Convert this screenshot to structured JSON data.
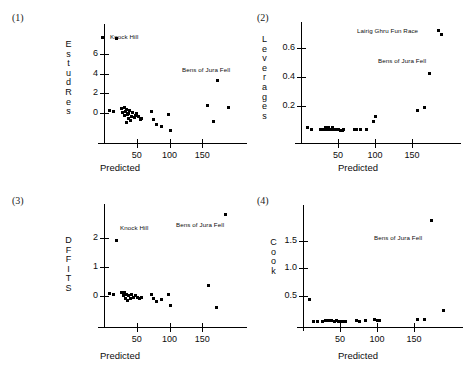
{
  "figure": {
    "background": "#ffffff",
    "marker_color": "#000000",
    "axis_color": "#000000",
    "width": 457,
    "height": 376
  },
  "panels": [
    {
      "number": "(1)",
      "ylabel": "EstudRes",
      "xlabel": "Predicted",
      "yticks": [
        "0",
        "2",
        "4",
        "6"
      ],
      "xticks": [
        "50",
        "100",
        "150"
      ],
      "annotations": [
        {
          "text": "Knock Hill",
          "has_marker": true
        },
        {
          "text": "Bens of Jura Fell",
          "has_marker": false
        }
      ]
    },
    {
      "number": "(2)",
      "ylabel": "Leverages",
      "xlabel": "Predicted",
      "yticks": [
        "0.2",
        "0.4",
        "0.6"
      ],
      "xticks": [
        "50",
        "100",
        "150"
      ],
      "annotations": [
        {
          "text": "Lairig Ghru Fun Race",
          "has_marker": true
        },
        {
          "text": "Bens of Jura Fell",
          "has_marker": false
        }
      ]
    },
    {
      "number": "(3)",
      "ylabel": "DFFITS",
      "xlabel": "Predicted",
      "yticks": [
        "0",
        "1",
        "2"
      ],
      "xticks": [
        "50",
        "100",
        "150"
      ],
      "annotations": [
        {
          "text": "Knock Hill",
          "has_marker": false
        },
        {
          "text": "Bens of Jura Fell",
          "has_marker": false
        }
      ]
    },
    {
      "number": "(4)",
      "ylabel": "Cook",
      "xlabel": "Predicted",
      "yticks": [
        "0.5",
        "1.0",
        "1.5"
      ],
      "xticks": [
        "50",
        "100",
        "150"
      ],
      "annotations": [
        {
          "text": "Bens of Jura Fell",
          "has_marker": false
        }
      ]
    }
  ],
  "chart_data": [
    {
      "type": "scatter",
      "title": "(1)",
      "xlabel": "Predicted",
      "ylabel": "EstudRes",
      "xlim": [
        0,
        200
      ],
      "ylim": [
        -2.2,
        8.2
      ],
      "xticks": [
        50,
        100,
        150
      ],
      "yticks": [
        0,
        2,
        4,
        6
      ],
      "grid": false,
      "legend": "none",
      "annotations": [
        {
          "text": "Knock Hill",
          "x": 25,
          "y": 7.6
        },
        {
          "text": "Bens of Jura Fell",
          "x": 160,
          "y": 4.5
        }
      ],
      "points": [
        {
          "x": 9,
          "y": 0.3
        },
        {
          "x": 14,
          "y": 0.2
        },
        {
          "x": 19,
          "y": 7.5
        },
        {
          "x": 27,
          "y": 0.5
        },
        {
          "x": 29,
          "y": 0.1
        },
        {
          "x": 31,
          "y": 0.6
        },
        {
          "x": 32,
          "y": -0.2
        },
        {
          "x": 33,
          "y": 0.2
        },
        {
          "x": 34,
          "y": -0.9
        },
        {
          "x": 35,
          "y": 0.4
        },
        {
          "x": 36,
          "y": -0.1
        },
        {
          "x": 37,
          "y": 0.0
        },
        {
          "x": 38,
          "y": -0.5
        },
        {
          "x": 39,
          "y": 0.3
        },
        {
          "x": 40,
          "y": -0.7
        },
        {
          "x": 42,
          "y": -0.3
        },
        {
          "x": 44,
          "y": 0.1
        },
        {
          "x": 46,
          "y": -0.4
        },
        {
          "x": 48,
          "y": -0.2
        },
        {
          "x": 50,
          "y": 0.0
        },
        {
          "x": 53,
          "y": -0.3
        },
        {
          "x": 56,
          "y": -0.6
        },
        {
          "x": 58,
          "y": -0.5
        },
        {
          "x": 72,
          "y": 0.2
        },
        {
          "x": 75,
          "y": -0.6
        },
        {
          "x": 80,
          "y": -1.1
        },
        {
          "x": 88,
          "y": -1.3
        },
        {
          "x": 98,
          "y": -0.1
        },
        {
          "x": 101,
          "y": -1.7
        },
        {
          "x": 158,
          "y": 0.8
        },
        {
          "x": 167,
          "y": -0.8
        },
        {
          "x": 173,
          "y": 3.3
        },
        {
          "x": 190,
          "y": 0.6
        }
      ]
    },
    {
      "type": "scatter",
      "title": "(2)",
      "xlabel": "Predicted",
      "ylabel": "Leverages",
      "xlim": [
        0,
        200
      ],
      "ylim": [
        0.0,
        0.72
      ],
      "xticks": [
        50,
        100,
        150
      ],
      "yticks": [
        0.2,
        0.4,
        0.6
      ],
      "grid": false,
      "legend": "none",
      "annotations": [
        {
          "text": "Lairig Ghru Fun Race",
          "x": 120,
          "y": 0.69
        },
        {
          "text": "Bens of Jura Fell",
          "x": 135,
          "y": 0.5
        }
      ],
      "points": [
        {
          "x": 9,
          "y": 0.05
        },
        {
          "x": 14,
          "y": 0.04
        },
        {
          "x": 27,
          "y": 0.04
        },
        {
          "x": 30,
          "y": 0.04
        },
        {
          "x": 33,
          "y": 0.05
        },
        {
          "x": 35,
          "y": 0.04
        },
        {
          "x": 37,
          "y": 0.05
        },
        {
          "x": 39,
          "y": 0.04
        },
        {
          "x": 41,
          "y": 0.04
        },
        {
          "x": 43,
          "y": 0.05
        },
        {
          "x": 45,
          "y": 0.04
        },
        {
          "x": 47,
          "y": 0.04
        },
        {
          "x": 50,
          "y": 0.04
        },
        {
          "x": 53,
          "y": 0.03
        },
        {
          "x": 56,
          "y": 0.03
        },
        {
          "x": 58,
          "y": 0.04
        },
        {
          "x": 72,
          "y": 0.04
        },
        {
          "x": 75,
          "y": 0.04
        },
        {
          "x": 80,
          "y": 0.04
        },
        {
          "x": 88,
          "y": 0.04
        },
        {
          "x": 98,
          "y": 0.09
        },
        {
          "x": 101,
          "y": 0.13
        },
        {
          "x": 158,
          "y": 0.17
        },
        {
          "x": 167,
          "y": 0.19
        },
        {
          "x": 173,
          "y": 0.42
        },
        {
          "x": 190,
          "y": 0.69
        }
      ]
    },
    {
      "type": "scatter",
      "title": "(3)",
      "xlabel": "Predicted",
      "ylabel": "DFFITS",
      "xlim": [
        0,
        200
      ],
      "ylim": [
        -0.8,
        2.9
      ],
      "xticks": [
        50,
        100,
        150
      ],
      "yticks": [
        0,
        1,
        2
      ],
      "grid": false,
      "legend": "none",
      "annotations": [
        {
          "text": "Knock Hill",
          "x": 40,
          "y": 2.45
        },
        {
          "text": "Bens of Jura Fell",
          "x": 135,
          "y": 2.5
        }
      ],
      "points": [
        {
          "x": 9,
          "y": 0.08
        },
        {
          "x": 14,
          "y": 0.05
        },
        {
          "x": 19,
          "y": 1.9
        },
        {
          "x": 27,
          "y": 0.1
        },
        {
          "x": 30,
          "y": 0.0
        },
        {
          "x": 32,
          "y": 0.12
        },
        {
          "x": 33,
          "y": -0.08
        },
        {
          "x": 35,
          "y": 0.05
        },
        {
          "x": 36,
          "y": -0.15
        },
        {
          "x": 38,
          "y": 0.0
        },
        {
          "x": 40,
          "y": -0.1
        },
        {
          "x": 42,
          "y": 0.05
        },
        {
          "x": 45,
          "y": -0.05
        },
        {
          "x": 48,
          "y": 0.0
        },
        {
          "x": 51,
          "y": -0.07
        },
        {
          "x": 54,
          "y": -0.1
        },
        {
          "x": 57,
          "y": -0.05
        },
        {
          "x": 72,
          "y": 0.05
        },
        {
          "x": 75,
          "y": -0.1
        },
        {
          "x": 80,
          "y": -0.2
        },
        {
          "x": 88,
          "y": -0.12
        },
        {
          "x": 98,
          "y": 0.05
        },
        {
          "x": 101,
          "y": -0.35
        },
        {
          "x": 160,
          "y": 0.35
        },
        {
          "x": 172,
          "y": -0.4
        },
        {
          "x": 186,
          "y": 2.8
        }
      ]
    },
    {
      "type": "scatter",
      "title": "(4)",
      "xlabel": "Predicted",
      "ylabel": "Cook",
      "xlim": [
        0,
        200
      ],
      "ylim": [
        0.0,
        2.0
      ],
      "xticks": [
        50,
        100,
        150
      ],
      "yticks": [
        0.5,
        1.0,
        1.5
      ],
      "grid": false,
      "legend": "none",
      "annotations": [
        {
          "text": "Bens of Jura Fell",
          "x": 115,
          "y": 1.6
        }
      ],
      "points": [
        {
          "x": 9,
          "y": 0.43
        },
        {
          "x": 14,
          "y": 0.03
        },
        {
          "x": 20,
          "y": 0.03
        },
        {
          "x": 27,
          "y": 0.03
        },
        {
          "x": 30,
          "y": 0.04
        },
        {
          "x": 33,
          "y": 0.05
        },
        {
          "x": 36,
          "y": 0.04
        },
        {
          "x": 39,
          "y": 0.04
        },
        {
          "x": 42,
          "y": 0.03
        },
        {
          "x": 45,
          "y": 0.04
        },
        {
          "x": 48,
          "y": 0.03
        },
        {
          "x": 51,
          "y": 0.03
        },
        {
          "x": 54,
          "y": 0.03
        },
        {
          "x": 57,
          "y": 0.03
        },
        {
          "x": 72,
          "y": 0.04
        },
        {
          "x": 76,
          "y": 0.03
        },
        {
          "x": 84,
          "y": 0.04
        },
        {
          "x": 97,
          "y": 0.07
        },
        {
          "x": 100,
          "y": 0.04
        },
        {
          "x": 103,
          "y": 0.05
        },
        {
          "x": 155,
          "y": 0.07
        },
        {
          "x": 164,
          "y": 0.07
        },
        {
          "x": 173,
          "y": 1.87
        },
        {
          "x": 190,
          "y": 0.22
        }
      ]
    }
  ]
}
